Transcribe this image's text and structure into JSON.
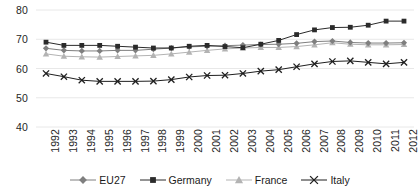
{
  "chart_data": {
    "type": "line",
    "title": "",
    "subtitle": "",
    "xlabel": "",
    "ylabel": "",
    "ylim": [
      40,
      80
    ],
    "yticks": [
      40,
      50,
      60,
      70,
      80
    ],
    "grid": true,
    "grid_axis": "y",
    "legend_position": "bottom",
    "categories": [
      "1992",
      "1993",
      "1994",
      "1995",
      "1996",
      "1997",
      "1998",
      "1999",
      "2000",
      "2001",
      "2002",
      "2003",
      "2004",
      "2005",
      "2006",
      "2007",
      "2008",
      "2009",
      "2010",
      "2011",
      "2012"
    ],
    "series": [
      {
        "name": "EU27",
        "marker": "diamond",
        "color": "#7f7f7f",
        "values": [
          66.9,
          66.2,
          66.0,
          66.0,
          66.2,
          66.2,
          66.6,
          67.0,
          67.4,
          67.6,
          67.8,
          68.0,
          68.2,
          68.3,
          68.6,
          69.2,
          69.4,
          68.9,
          68.7,
          68.7,
          68.8
        ]
      },
      {
        "name": "Germany",
        "marker": "square",
        "color": "#2b2b2b",
        "values": [
          69.0,
          67.9,
          67.9,
          67.9,
          67.6,
          67.3,
          67.0,
          67.0,
          67.6,
          67.9,
          67.5,
          67.1,
          68.3,
          69.6,
          71.6,
          73.2,
          74.0,
          74.1,
          74.8,
          76.2,
          76.2
        ]
      },
      {
        "name": "France",
        "marker": "triangle",
        "color": "#b3b3b3",
        "values": [
          65.0,
          64.2,
          64.0,
          63.9,
          64.1,
          64.3,
          64.5,
          65.0,
          65.6,
          66.2,
          66.7,
          67.0,
          67.2,
          67.2,
          67.5,
          68.1,
          68.8,
          68.3,
          68.1,
          68.1,
          68.2
        ]
      },
      {
        "name": "Italy",
        "marker": "x",
        "color": "#1f1f1f",
        "values": [
          58.3,
          57.2,
          56.0,
          55.6,
          55.6,
          55.6,
          55.7,
          56.2,
          57.1,
          57.6,
          57.7,
          58.3,
          59.1,
          59.6,
          60.6,
          61.6,
          62.4,
          62.6,
          62.1,
          61.6,
          62.1
        ]
      }
    ]
  },
  "legend": {
    "items": [
      {
        "label": "EU27",
        "marker": "diamond-marker-icon"
      },
      {
        "label": "Germany",
        "marker": "square-marker-icon"
      },
      {
        "label": "France",
        "marker": "triangle-marker-icon"
      },
      {
        "label": "Italy",
        "marker": "x-marker-icon"
      }
    ]
  }
}
